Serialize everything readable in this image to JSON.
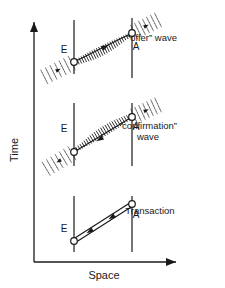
{
  "figure": {
    "title_semantics": "spacetime-diagram-transactional-interpretation",
    "background": "#ffffff",
    "ink": "#1a1a1a"
  },
  "axes": {
    "y_label": "Time",
    "x_label": "Space",
    "origin": {
      "x": 34,
      "y": 262
    },
    "y_tip": {
      "x": 34,
      "y": 20
    },
    "x_tip": {
      "x": 178,
      "y": 262
    }
  },
  "panels": [
    {
      "id": "offer",
      "caption": "“offer” wave",
      "caption_lines": [
        "“offer” wave"
      ],
      "caption_x": 152,
      "caption_y": 41,
      "emitter": {
        "label": "E",
        "label_x": 64,
        "label_y": 53,
        "node_x": 74,
        "node_y": 62,
        "line_top_y": 20,
        "line_bottom_y": 74
      },
      "absorber": {
        "label": "A",
        "label_x": 136,
        "label_y": 50,
        "node_x": 132,
        "node_y": 33,
        "line_top_y": 18,
        "line_bottom_y": 78
      },
      "wave": {
        "from_x": 74,
        "from_y": 62,
        "to_x": 132,
        "to_y": 33,
        "ticks": 26,
        "direction": "forward-in-time",
        "arrow_x": 105,
        "arrow_y": 47
      },
      "dashed_tail": {
        "x1": 42,
        "y1": 78,
        "x2": 74,
        "y2": 62
      },
      "dashed_head": {
        "x1": 132,
        "y1": 33,
        "x2": 160,
        "y2": 19
      }
    },
    {
      "id": "confirmation",
      "caption": "“confirmation” wave",
      "caption_lines": [
        "“confirmation”",
        "wave"
      ],
      "caption_x": 148,
      "caption_y": 129,
      "emitter": {
        "label": "E",
        "label_x": 64,
        "label_y": 132,
        "node_x": 74,
        "node_y": 152,
        "line_top_y": 103,
        "line_bottom_y": 166
      },
      "absorber": {
        "label": "A",
        "label_x": 136,
        "label_y": 130,
        "node_x": 132,
        "node_y": 117,
        "line_top_y": 103,
        "line_bottom_y": 166
      },
      "wave": {
        "from_x": 132,
        "from_y": 117,
        "to_x": 74,
        "to_y": 152,
        "ticks": 26,
        "direction": "backward-in-time",
        "arrow_x": 100,
        "arrow_y": 139
      },
      "dashed_tail": {
        "x1": 74,
        "y1": 152,
        "x2": 44,
        "y2": 170
      },
      "dashed_head": {
        "x1": 132,
        "y1": 117,
        "x2": 160,
        "y2": 104
      }
    },
    {
      "id": "transaction",
      "caption": "Transaction",
      "caption_lines": [
        "Transaction"
      ],
      "caption_x": 150,
      "caption_y": 214,
      "emitter": {
        "label": "E",
        "label_x": 64,
        "label_y": 232,
        "node_x": 74,
        "node_y": 241,
        "line_top_y": 196,
        "line_bottom_y": 252
      },
      "absorber": {
        "label": "A",
        "label_x": 136,
        "label_y": 218,
        "node_x": 132,
        "node_y": 204,
        "line_top_y": 196,
        "line_bottom_y": 252
      },
      "double_line": {
        "x1": 74,
        "y1": 241,
        "x2": 132,
        "y2": 204,
        "offset": 2
      },
      "arrows": [
        {
          "x": 90,
          "y": 231,
          "points": "left"
        },
        {
          "x": 112,
          "y": 217,
          "points": "left"
        }
      ]
    }
  ],
  "legend": {
    "emitter_meaning": "E",
    "absorber_meaning": "A"
  }
}
